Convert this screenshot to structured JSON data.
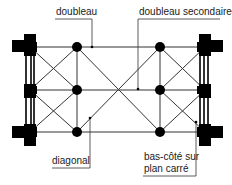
{
  "diagram": {
    "colors": {
      "line": "#333333",
      "fill": "#000000",
      "pier_gap": "#ffffff",
      "text": "#1a1a1a"
    },
    "labels": {
      "doubleau": "doubleau",
      "doubleau_secondaire": "doubleau secondaire",
      "diagonal": "diagonal",
      "bas_cote_line1": "bas-côté sur",
      "bas_cote_line2": "plan carré"
    }
  }
}
